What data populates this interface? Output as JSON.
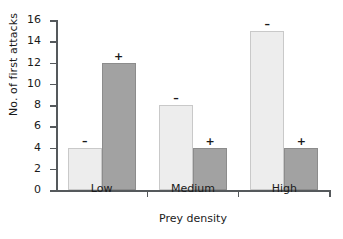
{
  "chart_data": {
    "type": "bar",
    "title": "",
    "subtitle": "",
    "xlabel": "Prey density",
    "ylabel": "No. of first attacks",
    "categories": [
      "Low",
      "Medium",
      "High"
    ],
    "series": [
      {
        "name": "-",
        "marker": "–",
        "color": "#ededed",
        "values": [
          4,
          8,
          15
        ]
      },
      {
        "name": "+",
        "marker": "+",
        "color": "#a2a2a2",
        "values": [
          12,
          4,
          4
        ]
      }
    ],
    "ylim": [
      0,
      16
    ],
    "ytick_labels": [
      "16",
      "14",
      "12",
      "10",
      "8",
      "6",
      "4",
      "2",
      "0"
    ],
    "ytick_values": [
      16,
      14,
      12,
      10,
      8,
      6,
      4,
      2,
      0
    ],
    "grid": false,
    "legend": "none",
    "annotations": [
      {
        "category": "Low",
        "series": "-",
        "text": "–",
        "value": 4
      },
      {
        "category": "Low",
        "series": "+",
        "text": "+",
        "value": 12
      },
      {
        "category": "Medium",
        "series": "-",
        "text": "–",
        "value": 8
      },
      {
        "category": "Medium",
        "series": "+",
        "text": "+",
        "value": 4
      },
      {
        "category": "High",
        "series": "-",
        "text": "–",
        "value": 15
      },
      {
        "category": "High",
        "series": "+",
        "text": "+",
        "value": 4
      }
    ]
  }
}
